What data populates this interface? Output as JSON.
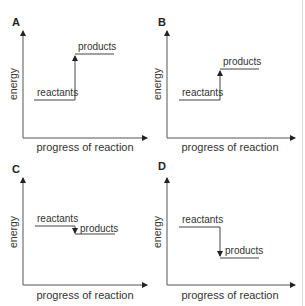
{
  "panels": [
    {
      "id": "A",
      "label": "A",
      "ylabel": "energy",
      "xlabel": "progress of reaction",
      "reactants_label": "reactants",
      "products_label": "products",
      "direction": "up",
      "reactants_level": "low",
      "products_level": "high (large increase)"
    },
    {
      "id": "B",
      "label": "B",
      "ylabel": "energy",
      "xlabel": "progress of reaction",
      "reactants_label": "reactants",
      "products_label": "products",
      "direction": "up",
      "reactants_level": "low",
      "products_level": "moderate increase"
    },
    {
      "id": "C",
      "label": "C",
      "ylabel": "energy",
      "xlabel": "progress of reaction",
      "reactants_label": "reactants",
      "products_label": "products",
      "direction": "down",
      "reactants_level": "high",
      "products_level": "slight decrease"
    },
    {
      "id": "D",
      "label": "D",
      "ylabel": "energy",
      "xlabel": "progress of reaction",
      "reactants_label": "reactants",
      "products_label": "products",
      "direction": "down",
      "reactants_level": "high",
      "products_level": "large decrease"
    }
  ],
  "colors": {
    "line": "#444444",
    "text": "#333333",
    "label": "#222222"
  }
}
